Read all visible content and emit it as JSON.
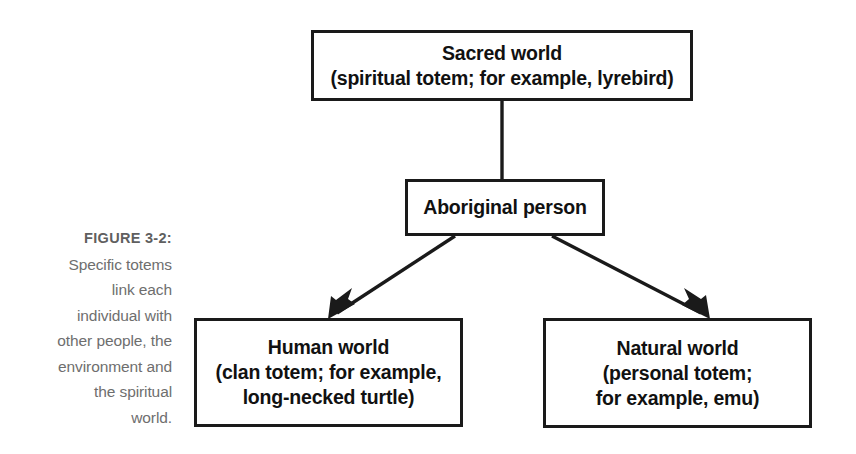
{
  "figure": {
    "caption_label": "FIGURE 3-2:",
    "caption_lines": [
      "Specific totems",
      "link each",
      "individual with",
      "other people, the",
      "environment and",
      "the spiritual",
      "world."
    ],
    "caption_text": "FIGURE 3-2: Specific totems link each individual with other people, the environment and the spiritual world.",
    "caption_color": "#6e6e6e"
  },
  "diagram": {
    "type": "flowchart",
    "line_color": "#1a1a1a",
    "box_fill": "#ffffff",
    "nodes": [
      {
        "id": "sacred-world",
        "lines": [
          "Sacred world",
          "(spiritual totem; for example, lyrebird)"
        ]
      },
      {
        "id": "aboriginal-person",
        "lines": [
          "Aboriginal person"
        ]
      },
      {
        "id": "human-world",
        "lines": [
          "Human world",
          "(clan totem; for example,",
          "long-necked turtle)"
        ]
      },
      {
        "id": "natural-world",
        "lines": [
          "Natural world",
          "(personal totem;",
          "for example, emu)"
        ]
      }
    ],
    "connectors": [
      {
        "id": "sacred-to-person",
        "from": "sacred-world",
        "to": "aboriginal-person",
        "style": "plain-line"
      },
      {
        "id": "person-to-human",
        "from": "aboriginal-person",
        "to": "human-world",
        "style": "arrow"
      },
      {
        "id": "person-to-natural",
        "from": "aboriginal-person",
        "to": "natural-world",
        "style": "arrow"
      }
    ]
  }
}
